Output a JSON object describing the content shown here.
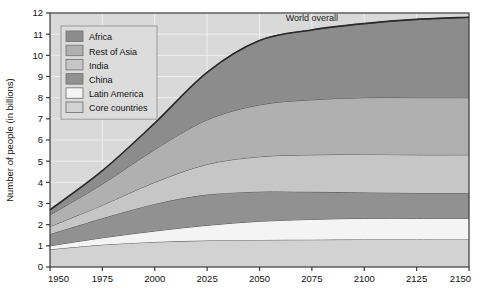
{
  "chart_data": {
    "type": "area",
    "stacked": true,
    "title": "",
    "xlabel": "",
    "ylabel": "Number of people (in billions)",
    "xlim": [
      1950,
      2150
    ],
    "ylim": [
      0,
      12
    ],
    "xticks": [
      1950,
      1975,
      2000,
      2025,
      2050,
      2075,
      2100,
      2125,
      2150
    ],
    "yticks": [
      0,
      1,
      2,
      3,
      4,
      5,
      6,
      7,
      8,
      9,
      10,
      11,
      12
    ],
    "grid": true,
    "legend_position": "top-left inside",
    "annotations": [
      {
        "text": "World overall",
        "x": 2075,
        "y": 11.6
      }
    ],
    "x": [
      1950,
      1975,
      2000,
      2025,
      2050,
      2075,
      2100,
      2125,
      2150
    ],
    "series": [
      {
        "name": "Core countries",
        "color": "#d2d2d2",
        "values": [
          0.83,
          1.05,
          1.18,
          1.25,
          1.28,
          1.29,
          1.3,
          1.3,
          1.3
        ]
      },
      {
        "name": "Latin America",
        "color": "#f4f4f4",
        "values": [
          0.17,
          0.33,
          0.52,
          0.72,
          0.88,
          0.96,
          1.0,
          1.0,
          1.0
        ]
      },
      {
        "name": "China",
        "color": "#919191",
        "values": [
          0.55,
          0.92,
          1.28,
          1.45,
          1.4,
          1.3,
          1.22,
          1.2,
          1.2
        ]
      },
      {
        "name": "India",
        "color": "#c6c6c6",
        "values": [
          0.36,
          0.62,
          1.02,
          1.43,
          1.65,
          1.75,
          1.8,
          1.8,
          1.8
        ]
      },
      {
        "name": "Rest of Asia",
        "color": "#b0b0b0",
        "values": [
          0.55,
          1.0,
          1.55,
          2.1,
          2.45,
          2.6,
          2.68,
          2.7,
          2.7
        ]
      },
      {
        "name": "Africa",
        "color": "#8c8c8c",
        "values": [
          0.24,
          0.63,
          1.25,
          2.25,
          3.04,
          3.3,
          3.5,
          3.7,
          3.8
        ]
      }
    ],
    "totals": [
      2.7,
      4.55,
      6.8,
      9.2,
      10.7,
      11.2,
      11.5,
      11.7,
      11.8
    ],
    "stack_order_bottom_to_top": [
      "Core countries",
      "Latin America",
      "China",
      "India",
      "Rest of Asia",
      "Africa"
    ],
    "legend_order_top_to_bottom": [
      "Africa",
      "Rest of Asia",
      "India",
      "China",
      "Latin America",
      "Core countries"
    ],
    "plot_bg_color": "#d9d9d9",
    "gridline_color": "#f0f0f0",
    "axis_color": "#3a3a3a"
  }
}
